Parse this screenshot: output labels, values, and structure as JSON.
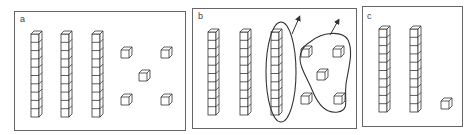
{
  "figure": {
    "panels": [
      {
        "label": "a",
        "tens_rods": 3,
        "unit_cubes": 5,
        "grouping": "none"
      },
      {
        "label": "b",
        "tens_rods": 3,
        "unit_cubes": 5,
        "grouping": "one rod circled and all unit cubes circled, each with an arrow pointing out (removed)"
      },
      {
        "label": "c",
        "tens_rods": 2,
        "unit_cubes": 1,
        "grouping": "none"
      }
    ],
    "colors": {
      "line": "#333333",
      "border": "#666666",
      "background": "#ffffff"
    }
  }
}
